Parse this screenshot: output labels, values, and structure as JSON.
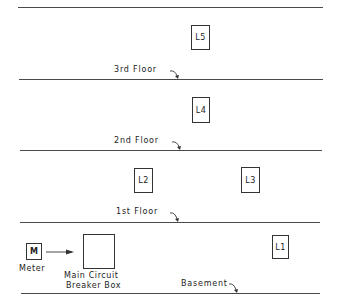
{
  "diagram": {
    "floors": [
      {
        "name": "roof",
        "label": ""
      },
      {
        "name": "3rd",
        "label": "3rd Floor"
      },
      {
        "name": "2nd",
        "label": "2nd Floor"
      },
      {
        "name": "1st",
        "label": "1st Floor"
      },
      {
        "name": "basement",
        "label": "Basement"
      }
    ],
    "lights": [
      {
        "id": "L5",
        "label": "L5"
      },
      {
        "id": "L4",
        "label": "L4"
      },
      {
        "id": "L2",
        "label": "L2"
      },
      {
        "id": "L3",
        "label": "L3"
      },
      {
        "id": "L1",
        "label": "L1"
      }
    ],
    "meter": {
      "symbol": "M",
      "label": "Meter"
    },
    "breaker_box": {
      "label_line1": "Main Circuit",
      "label_line2": "Breaker Box"
    },
    "colors": {
      "line": "#4a4a4a",
      "ink": "#222222",
      "background": "#ffffff"
    }
  }
}
